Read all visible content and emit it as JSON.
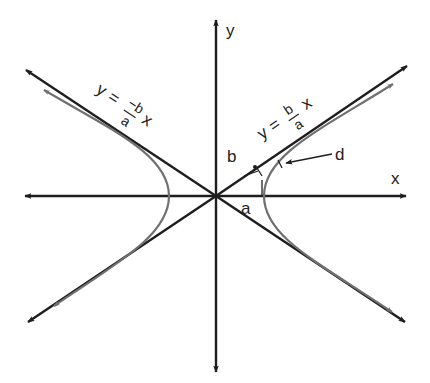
{
  "diagram": {
    "type": "hyperbola-with-asymptotes",
    "colors": {
      "axes": "#1e1e1e",
      "asymptotes": "#1e1e1e",
      "curve": "#707070",
      "text": "#222222",
      "background": "#ffffff"
    },
    "axes": {
      "x_label": "x",
      "y_label": "y"
    },
    "asymptote_left": {
      "y": "y",
      "equals": "=",
      "numerator": "−b",
      "denominator": "a",
      "x": "x"
    },
    "asymptote_right": {
      "y": "y",
      "equals": "=",
      "numerator": "b",
      "denominator": "a",
      "x": "x"
    },
    "segment_labels": {
      "a": "a",
      "b": "b",
      "d": "d"
    }
  }
}
